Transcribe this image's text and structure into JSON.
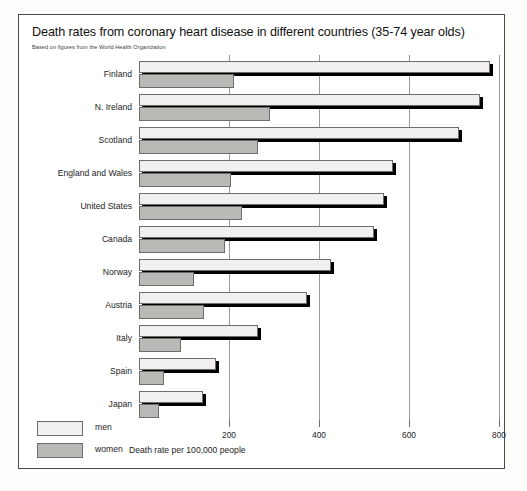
{
  "chart_data": {
    "type": "bar",
    "orientation": "horizontal",
    "title": "Death rates from coronary heart disease in different countries (35-74 year olds)",
    "subtitle": "Based on figures from the World Health Organization",
    "xlabel": "Death rate per 100,000 people",
    "ylabel": "",
    "xlim": [
      0,
      800
    ],
    "xticks": [
      200,
      400,
      600,
      800
    ],
    "xtick_labels": [
      "200",
      "400",
      "600",
      "800"
    ],
    "grid": true,
    "legend_position": "bottom-left",
    "categories": [
      "Finland",
      "N. Ireland",
      "Scotland",
      "England and Wales",
      "United States",
      "Canada",
      "Norway",
      "Austria",
      "Italy",
      "Spain",
      "Japan"
    ],
    "series": [
      {
        "name": "men",
        "color": "#f1f0ee",
        "values": [
          780,
          757,
          710,
          565,
          545,
          522,
          427,
          373,
          265,
          172,
          142
        ]
      },
      {
        "name": "women",
        "color": "#b9b9b6",
        "values": [
          210,
          290,
          265,
          205,
          228,
          190,
          122,
          145,
          93,
          55,
          45
        ]
      }
    ]
  },
  "legend": {
    "items": [
      {
        "label": "men",
        "swatch": "men"
      },
      {
        "label": "women",
        "swatch": "women"
      }
    ]
  }
}
